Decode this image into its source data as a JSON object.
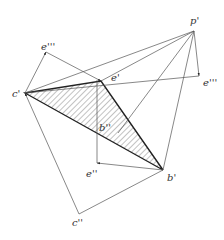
{
  "diagram": {
    "colors": {
      "line": "#555555",
      "bold": "#222222",
      "hatch": "#666666",
      "label": "#333333"
    },
    "points": {
      "c1": {
        "label": "c'",
        "x": 25,
        "y": 93
      },
      "e1": {
        "label": "e'",
        "x": 101,
        "y": 81
      },
      "p1": {
        "label": "p'",
        "x": 194,
        "y": 31
      },
      "b1": {
        "label": "b'",
        "x": 163,
        "y": 170
      },
      "e3_left": {
        "label": "e'''",
        "x": 46,
        "y": 52
      },
      "e3_right": {
        "label": "e'''",
        "x": 199,
        "y": 76
      },
      "b2": {
        "label": "b''",
        "x": 118,
        "y": 133
      },
      "e2": {
        "label": "e''",
        "x": 97,
        "y": 163
      },
      "c2": {
        "label": "c''",
        "x": 79,
        "y": 214
      }
    },
    "labels": {
      "c1": "c'",
      "e1": "e'",
      "p1": "p'",
      "b1": "b'",
      "e3_left": "e'''",
      "e3_right": "e'''",
      "b2": "b''",
      "e2": "e''",
      "c2": "c''"
    }
  }
}
